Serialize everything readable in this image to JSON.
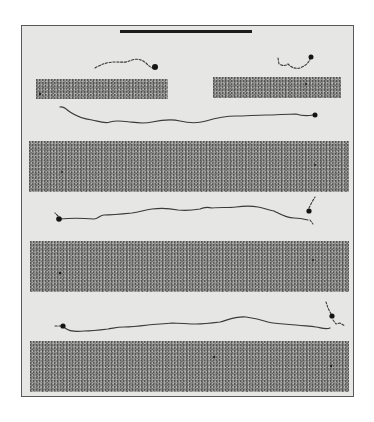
{
  "figure": {
    "description": "Electron micrograph-style figure of elongated filamentous molecules with globular heads, shown between gray substrate bands, with a scale bar at top",
    "colors": {
      "page_background": "#ffffff",
      "panel_background": "#e6e6e4",
      "frame_border": "#5a5a5a",
      "band_fill": "#8c8c8a",
      "filament": "#3a3a3a",
      "scale_bar": "#1c1c1c"
    },
    "scale_bar": {
      "x1": 120,
      "x2": 252,
      "y": 31,
      "thickness": 3
    },
    "bands": [
      {
        "id": "band-short-left",
        "x": 36,
        "y": 79,
        "w": 132,
        "h": 20
      },
      {
        "id": "band-short-right",
        "x": 213,
        "y": 77,
        "w": 128,
        "h": 21
      },
      {
        "id": "band-1",
        "x": 29,
        "y": 141,
        "w": 320,
        "h": 51
      },
      {
        "id": "band-2",
        "x": 30,
        "y": 241,
        "w": 319,
        "h": 51
      },
      {
        "id": "band-3",
        "x": 30,
        "y": 341,
        "w": 319,
        "h": 51
      }
    ],
    "molecules": [
      {
        "id": "short-fragment-left",
        "style": "dashed",
        "path": "M95,68 C102,64 108,62 115,62 C122,62 126,63 132,60 C138,58 142,60 146,63 C149,66 151,68 154,68",
        "heads": [
          {
            "cx": 155,
            "cy": 67,
            "r": 3
          }
        ]
      },
      {
        "id": "short-fragment-right",
        "style": "dashed",
        "path": "M278,58 L279,64 C283,66 286,66 288,64 C292,68 296,69 300,68 C305,66 309,63 311,57",
        "heads": [
          {
            "cx": 311,
            "cy": 57,
            "r": 2.5
          }
        ]
      },
      {
        "id": "filament-1",
        "style": "solid",
        "path": "M60,107 C64,106 67,110 70,112 C76,116 84,119 92,120 C98,121 104,124 110,122 C116,120 122,121 130,122 C138,123 144,124 152,122 C162,120 172,119 180,121 C188,123 196,124 206,121 C216,118 226,116 236,116 C246,116 256,115 266,115 C276,115 286,114 296,114 C302,116 308,116 313,115",
        "heads": [
          {
            "cx": 315,
            "cy": 115,
            "r": 2.5
          }
        ]
      },
      {
        "id": "filament-2",
        "style": "solid",
        "path": "M60,219 C70,218 82,218 94,219 C98,219 100,215 104,215 C112,215 122,214 132,213 C140,212 144,210 152,209 C160,208 168,208 178,210 C186,211 194,210 200,209 C204,207 208,207 212,208 C220,207 228,208 236,207 C244,206 252,206 258,207 C264,208 268,210 274,211 C280,214 286,218 294,218 C300,218 304,219 308,220",
        "heads": [
          {
            "cx": 59,
            "cy": 219,
            "r": 2.8
          },
          {
            "cx": 309,
            "cy": 211,
            "r": 2.6
          }
        ],
        "tails": [
          {
            "path": "M309,208 L312,202 L315,197",
            "style": "dashed"
          },
          {
            "path": "M310,220 L313,224",
            "style": "dashed"
          },
          {
            "path": "M58,216 L55,213",
            "style": "dashed"
          }
        ]
      },
      {
        "id": "filament-3",
        "style": "solid",
        "path": "M65,328 C70,332 76,332 84,331 C92,331 100,330 108,329 C114,328 118,327 124,327 C132,327 140,326 148,325 C156,324 164,324 172,323 C180,323 188,324 196,324 C204,324 212,323 220,322 C228,320 236,316 246,317 C254,318 262,320 268,322 C276,324 286,324 296,325 C304,326 310,326 316,327 C322,328 326,330 330,328",
        "heads": [
          {
            "cx": 63,
            "cy": 326,
            "r": 2.6
          },
          {
            "cx": 332,
            "cy": 316,
            "r": 2.6
          }
        ],
        "tails": [
          {
            "path": "M331,314 L328,308 L326,302",
            "style": "dashed"
          },
          {
            "path": "M333,320 L336,324 L340,323 L345,326",
            "style": "dashed"
          },
          {
            "path": "M61,326 L55,326",
            "style": "dashed"
          }
        ]
      }
    ],
    "specks": [
      {
        "cx": 40,
        "cy": 94,
        "r": 1.2
      },
      {
        "cx": 306,
        "cy": 84,
        "r": 1
      },
      {
        "cx": 62,
        "cy": 172,
        "r": 1
      },
      {
        "cx": 315,
        "cy": 165,
        "r": 1
      },
      {
        "cx": 60,
        "cy": 273,
        "r": 1.3
      },
      {
        "cx": 313,
        "cy": 260,
        "r": 1
      },
      {
        "cx": 214,
        "cy": 357,
        "r": 1.3
      },
      {
        "cx": 331,
        "cy": 366,
        "r": 1.2
      }
    ]
  }
}
